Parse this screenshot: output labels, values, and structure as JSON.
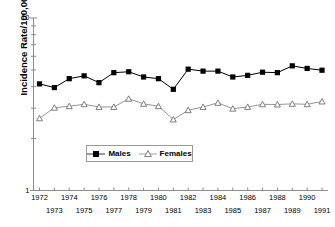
{
  "chart_data": {
    "type": "line",
    "title": "",
    "xlabel": "",
    "ylabel": "Incidence Rate/100,000",
    "yscale": "log",
    "ylim": [
      1,
      10
    ],
    "ytick_labels": [
      "10",
      "1"
    ],
    "grid": false,
    "legend_position": "inside-bottom-center",
    "x": [
      1972,
      1973,
      1974,
      1975,
      1976,
      1977,
      1978,
      1979,
      1980,
      1981,
      1982,
      1983,
      1984,
      1985,
      1986,
      1987,
      1988,
      1989,
      1990,
      1991
    ],
    "x_top_row": [
      "1972",
      "",
      "1974",
      "",
      "1976",
      "",
      "1978",
      "",
      "1980",
      "",
      "1982",
      "",
      "1984",
      "",
      "1986",
      "",
      "1988",
      "",
      "1990",
      ""
    ],
    "x_bottom_row": [
      "",
      "1973",
      "",
      "1975",
      "",
      "1977",
      "",
      "1979",
      "",
      "1981",
      "",
      "1983",
      "",
      "1985",
      "",
      "1987",
      "",
      "1989",
      "",
      "1991"
    ],
    "series": [
      {
        "name": "Males",
        "marker": "filled-square",
        "color": "#000000",
        "values": [
          4.15,
          3.95,
          4.45,
          4.62,
          4.22,
          4.82,
          4.88,
          4.55,
          4.45,
          3.86,
          5.05,
          4.92,
          4.92,
          4.55,
          4.65,
          4.85,
          4.82,
          5.28,
          5.1,
          4.98
        ]
      },
      {
        "name": "Females",
        "marker": "open-triangle",
        "color": "#7a7a7a",
        "values": [
          2.62,
          3.02,
          3.08,
          3.16,
          3.05,
          3.05,
          3.4,
          3.18,
          3.08,
          2.58,
          2.92,
          3.05,
          3.22,
          2.98,
          3.05,
          3.16,
          3.15,
          3.18,
          3.16,
          3.28
        ]
      }
    ]
  },
  "legend": {
    "items": [
      {
        "label": "Males",
        "symbol": "filled-square"
      },
      {
        "label": "Females",
        "symbol": "open-triangle"
      }
    ]
  }
}
